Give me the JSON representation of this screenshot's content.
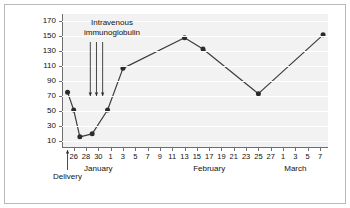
{
  "figure": {
    "background": "#ffffff",
    "plot_background": "#f2f2f2",
    "line_color": "#3c3c3c",
    "marker_color": "#2b2b2b",
    "axis_color": "#6e6e6e"
  },
  "chart_data": {
    "type": "line",
    "title": "",
    "xlabel": "",
    "ylabel": "Platelet count 10",
    "ylabel_exponent": "9",
    "ylabel_suffix": "/l",
    "ylim": [
      0,
      180
    ],
    "yticks": [
      10,
      30,
      50,
      70,
      90,
      110,
      130,
      150,
      170
    ],
    "ytick_labels": [
      "10",
      "30",
      "50",
      "70",
      "90",
      "110",
      "130",
      "150",
      "170"
    ],
    "grid": true,
    "grid_axis": "y",
    "legend": false,
    "x_tick_labels": [
      "26",
      "28",
      "30",
      "1",
      "3",
      "5",
      "7",
      "9",
      "11",
      "13",
      "15",
      "17",
      "19",
      "21",
      "23",
      "25",
      "27",
      "1",
      "3",
      "5",
      "7"
    ],
    "x_tick_days": [
      26,
      28,
      30,
      1,
      3,
      5,
      7,
      9,
      11,
      13,
      15,
      17,
      19,
      21,
      23,
      25,
      27,
      1,
      3,
      5,
      7
    ],
    "month_labels": [
      {
        "label": "January",
        "day_index": 2
      },
      {
        "label": "February",
        "day_index": 11
      },
      {
        "label": "March",
        "day_index": 18
      }
    ],
    "series": [
      {
        "name": "Platelet count",
        "x": [
          25.0,
          26.0,
          27.0,
          29.0,
          31.5,
          34.0,
          44.0,
          47.0,
          56.0,
          66.5
        ],
        "x_labels": [
          "25 Jan",
          "26 Jan",
          "27 Jan",
          "29 Jan",
          "1 Feb",
          "3 Feb",
          "13 Feb",
          "16 Feb",
          "25 Feb",
          "7 Mar"
        ],
        "values": [
          75,
          51,
          15,
          19,
          51,
          107,
          148,
          133,
          73,
          152
        ]
      }
    ],
    "annotations": [
      {
        "name": "ivig-label",
        "text_line1": "Intravenous",
        "text_line2": "immunoglobulin",
        "arrows_x": [
          28.7,
          29.7,
          30.7
        ],
        "arrow_count": 3
      },
      {
        "name": "delivery-marker",
        "text": "Delivery",
        "x": 25.0
      }
    ]
  }
}
